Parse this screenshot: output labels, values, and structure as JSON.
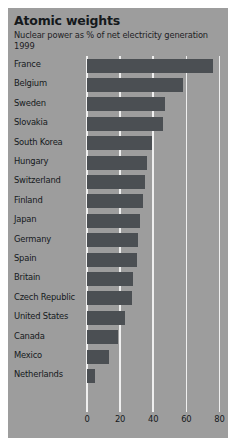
{
  "chart_data": {
    "type": "bar",
    "orientation": "horizontal",
    "title": "Atomic weights",
    "subtitle": "Nuclear power as % of net electricity generation",
    "year_label": "1999",
    "xlabel": "",
    "ylabel": "",
    "xlim": [
      0,
      80
    ],
    "ticks": [
      0,
      20,
      40,
      60,
      80
    ],
    "tick_labels": [
      "0",
      "20",
      "40",
      "60",
      "80"
    ],
    "grid": true,
    "grid_axis": "x",
    "legend": false,
    "categories": [
      "France",
      "Belgium",
      "Sweden",
      "Slovakia",
      "South Korea",
      "Hungary",
      "Switzerland",
      "Finland",
      "Japan",
      "Germany",
      "Spain",
      "Britain",
      "Czech Republic",
      "United States",
      "Canada",
      "Mexico",
      "Netherlands"
    ],
    "values": [
      76,
      58,
      47,
      46,
      39,
      36,
      35,
      34,
      32,
      31,
      30,
      28,
      27,
      23,
      19,
      13,
      5
    ],
    "bar_color": "#4b4f53",
    "panel_color": "#9d9d9d",
    "grid_color": "#efefef",
    "text_color": "#15191c"
  }
}
